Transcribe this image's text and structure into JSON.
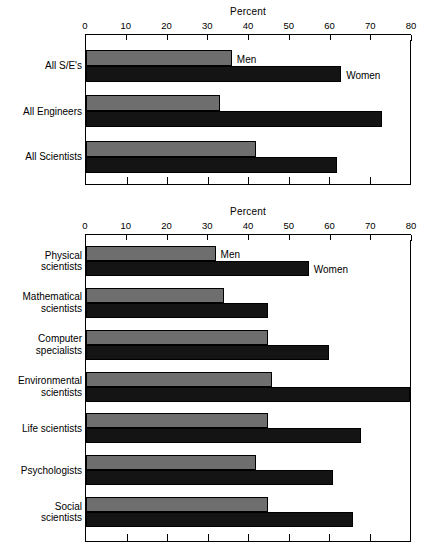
{
  "chart_data": [
    {
      "id": "top",
      "type": "bar",
      "orientation": "horizontal",
      "title": "Percent",
      "xlabel": "Percent",
      "ylabel": "",
      "xlim": [
        0,
        80
      ],
      "xticks": [
        0,
        10,
        20,
        30,
        40,
        50,
        60,
        70,
        80
      ],
      "tick_labels": [
        "0",
        "10",
        "20",
        "30",
        "40",
        "50",
        "60",
        "70",
        "80"
      ],
      "grid": false,
      "legend_position": "inline-first-group",
      "categories": [
        "All S/E's",
        "All Engineers",
        "All Scientists"
      ],
      "series": [
        {
          "name": "Men",
          "color": "#6e6e6e",
          "values": [
            36,
            33,
            42
          ]
        },
        {
          "name": "Women",
          "color": "#141414",
          "values": [
            63,
            73,
            62
          ]
        }
      ],
      "annotations": [
        {
          "text": "Men",
          "series": "Men",
          "category": "All S/E's"
        },
        {
          "text": "Women",
          "series": "Women",
          "category": "All S/E's"
        }
      ]
    },
    {
      "id": "bottom",
      "type": "bar",
      "orientation": "horizontal",
      "title": "Percent",
      "xlabel": "Percent",
      "ylabel": "",
      "xlim": [
        0,
        80
      ],
      "xticks": [
        0,
        10,
        20,
        30,
        40,
        50,
        60,
        70,
        80
      ],
      "tick_labels": [
        "0",
        "10",
        "20",
        "30",
        "40",
        "50",
        "60",
        "70",
        "80"
      ],
      "grid": false,
      "legend_position": "inline-first-group",
      "categories": [
        "Physical\nscientists",
        "Mathematical\nscientists",
        "Computer\nspecialists",
        "Environmental\nscientists",
        "Life scientists",
        "Psychologists",
        "Social\nscientists"
      ],
      "series": [
        {
          "name": "Men",
          "color": "#6e6e6e",
          "values": [
            32,
            34,
            45,
            46,
            45,
            42,
            45
          ]
        },
        {
          "name": "Women",
          "color": "#141414",
          "values": [
            55,
            45,
            60,
            80,
            68,
            61,
            66
          ]
        }
      ],
      "annotations": [
        {
          "text": "Men",
          "series": "Men",
          "category": "Physical\nscientists"
        },
        {
          "text": "Women",
          "series": "Women",
          "category": "Physical\nscientists"
        }
      ]
    }
  ],
  "top_chart": {
    "axis_title": "Percent",
    "ticks": [
      "0",
      "10",
      "20",
      "30",
      "40",
      "50",
      "60",
      "70",
      "80"
    ],
    "rows": [
      {
        "label": "All S/E's",
        "men": 36,
        "women": 63
      },
      {
        "label": "All Engineers",
        "men": 33,
        "women": 73
      },
      {
        "label": "All Scientists",
        "men": 42,
        "women": 62
      }
    ],
    "men_tag": "Men",
    "women_tag": "Women"
  },
  "bottom_chart": {
    "axis_title": "Percent",
    "ticks": [
      "0",
      "10",
      "20",
      "30",
      "40",
      "50",
      "60",
      "70",
      "80"
    ],
    "rows": [
      {
        "label": "Physical\nscientists",
        "men": 32,
        "women": 55
      },
      {
        "label": "Mathematical\nscientists",
        "men": 34,
        "women": 45
      },
      {
        "label": "Computer\nspecialists",
        "men": 45,
        "women": 60
      },
      {
        "label": "Environmental\nscientists",
        "men": 46,
        "women": 80
      },
      {
        "label": "Life scientists",
        "men": 45,
        "women": 68
      },
      {
        "label": "Psychologists",
        "men": 42,
        "women": 61
      },
      {
        "label": "Social\nscientists",
        "men": 45,
        "women": 66
      }
    ],
    "men_tag": "Men",
    "women_tag": "Women"
  }
}
